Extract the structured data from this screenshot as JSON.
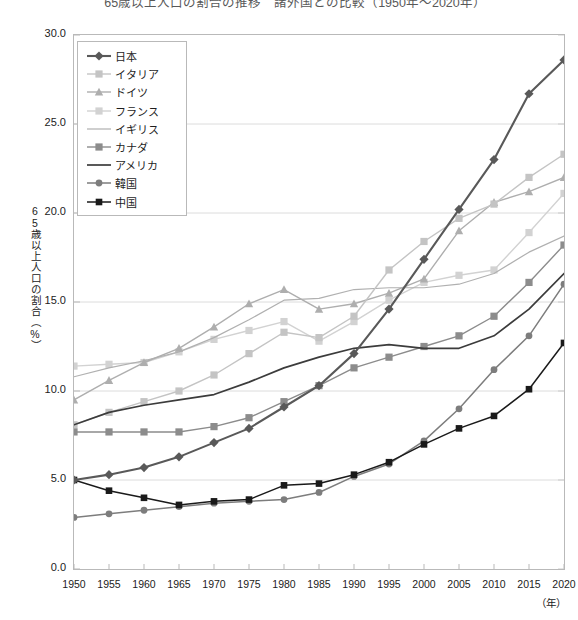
{
  "chart_data": {
    "type": "line",
    "title": "65歳以上人口の割合の推移　諸外国との比較（1950年～2020年）",
    "xlabel": "（年）",
    "ylabel": "65歳以上人口の割合（%）",
    "x_unit_label": "（年）",
    "grid": true,
    "legend_position": "inside-top-left",
    "xlim": [
      1950,
      2020
    ],
    "ylim": [
      0.0,
      30.0
    ],
    "ytick_labels": [
      "30.0",
      "25.0",
      "20.0",
      "15.0",
      "10.0",
      "5.0",
      "0.0"
    ],
    "ytick_values": [
      30.0,
      25.0,
      20.0,
      15.0,
      10.0,
      5.0,
      0.0
    ],
    "categories": [
      1950,
      1955,
      1960,
      1965,
      1970,
      1975,
      1980,
      1985,
      1990,
      1995,
      2000,
      2005,
      2010,
      2015,
      2020
    ],
    "xtick_labels": [
      "1950",
      "1955",
      "1960",
      "1965",
      "1970",
      "1975",
      "1980",
      "1985",
      "1990",
      "1995",
      "2000",
      "2005",
      "2010",
      "2015",
      "2020"
    ],
    "series": [
      {
        "name": "日本",
        "marker": "diamond",
        "color": "#595959",
        "width": 2.1,
        "values": [
          5.0,
          5.3,
          5.7,
          6.3,
          7.1,
          7.9,
          9.1,
          10.3,
          12.1,
          14.6,
          17.4,
          20.2,
          23.0,
          26.7,
          28.6
        ]
      },
      {
        "name": "イタリア",
        "marker": "square",
        "color": "#c4c4c4",
        "width": 1.4,
        "values": [
          8.1,
          8.8,
          9.4,
          10.0,
          10.9,
          12.1,
          13.3,
          13.0,
          14.2,
          16.8,
          18.4,
          19.7,
          20.5,
          22.0,
          23.3
        ]
      },
      {
        "name": "ドイツ",
        "marker": "triangle",
        "color": "#aeaeae",
        "width": 1.4,
        "values": [
          9.5,
          10.6,
          11.6,
          12.4,
          13.6,
          14.9,
          15.7,
          14.6,
          14.9,
          15.5,
          16.3,
          19.0,
          20.6,
          21.2,
          22.0
        ]
      },
      {
        "name": "フランス",
        "marker": "square",
        "color": "#d2d2d2",
        "width": 1.4,
        "values": [
          11.4,
          11.5,
          11.6,
          12.2,
          12.9,
          13.4,
          13.9,
          12.8,
          13.9,
          15.1,
          16.1,
          16.5,
          16.8,
          18.9,
          21.1
        ]
      },
      {
        "name": "イギリス",
        "marker": "none",
        "color": "#b0b0b0",
        "width": 1.2,
        "values": [
          10.8,
          11.3,
          11.7,
          12.2,
          13.0,
          14.0,
          15.1,
          15.2,
          15.7,
          15.8,
          15.8,
          16.0,
          16.6,
          17.8,
          18.7
        ]
      },
      {
        "name": "カナダ",
        "marker": "square",
        "color": "#8c8c8c",
        "width": 1.4,
        "values": [
          7.7,
          7.7,
          7.7,
          7.7,
          8.0,
          8.5,
          9.4,
          10.3,
          11.3,
          11.9,
          12.5,
          13.1,
          14.2,
          16.1,
          18.2
        ]
      },
      {
        "name": "アメリカ",
        "marker": "none",
        "color": "#3c3c3c",
        "width": 1.7,
        "values": [
          8.1,
          8.8,
          9.2,
          9.5,
          9.8,
          10.5,
          11.3,
          11.9,
          12.4,
          12.6,
          12.4,
          12.4,
          13.1,
          14.6,
          16.6
        ]
      },
      {
        "name": "韓国",
        "marker": "circle",
        "color": "#7d7d7d",
        "width": 1.5,
        "values": [
          2.9,
          3.1,
          3.3,
          3.5,
          3.7,
          3.8,
          3.9,
          4.3,
          5.2,
          5.9,
          7.2,
          9.0,
          11.2,
          13.1,
          16.0
        ]
      },
      {
        "name": "中国",
        "marker": "square-dark",
        "color": "#1a1a1a",
        "width": 1.5,
        "values": [
          5.0,
          4.4,
          4.0,
          3.6,
          3.8,
          3.9,
          4.7,
          4.8,
          5.3,
          6.0,
          7.0,
          7.9,
          8.6,
          10.1,
          12.7
        ]
      }
    ]
  },
  "legend": {
    "items": [
      {
        "label": "日本"
      },
      {
        "label": "イタリア"
      },
      {
        "label": "ドイツ"
      },
      {
        "label": "フランス"
      },
      {
        "label": "イギリス"
      },
      {
        "label": "カナダ"
      },
      {
        "label": "アメリカ"
      },
      {
        "label": "韓国"
      },
      {
        "label": "中国"
      }
    ]
  },
  "colors": {
    "frame": "#b9b9b9",
    "grid": "#dcdcdc",
    "text": "#222222"
  }
}
